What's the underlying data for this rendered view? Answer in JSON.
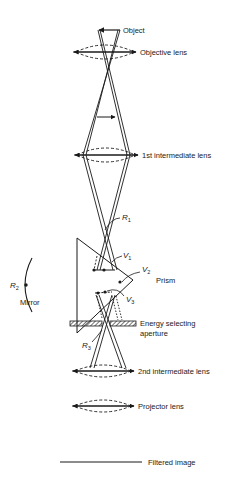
{
  "diagram": {
    "type": "electron-optics ray diagram (energy filtering with prism-mirror system)",
    "labels": {
      "object": "Object",
      "objective_lens": "Objective lens",
      "first_intermediate_lens": "1st intermediate lens",
      "r1": "R",
      "r1_sub": "1",
      "r2": "R",
      "r2_sub": "2",
      "r3": "R",
      "r3_sub": "3",
      "v1": "V",
      "v1_sub": "1",
      "v2": "V",
      "v2_sub": "2",
      "v3": "V",
      "v3_sub": "3",
      "prism": "Prism",
      "mirror": "Mirror",
      "aperture_line1": "Energy selecting",
      "aperture_line2": "aperture",
      "second_intermediate_lens": "2nd intermediate lens",
      "projector_lens": "Projector lens",
      "filtered_image": "Filtered image"
    },
    "colors": {
      "ink": "#1a1a1a",
      "background": "#ffffff"
    }
  }
}
